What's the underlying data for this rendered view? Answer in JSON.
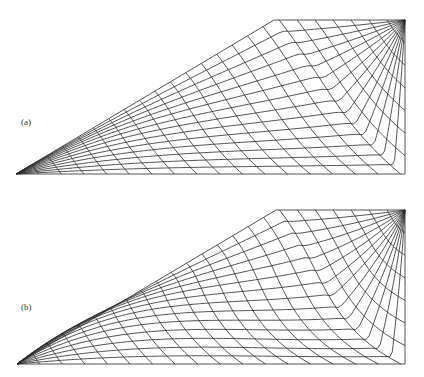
{
  "figure": {
    "panels": [
      {
        "id": "a",
        "label": "(a)",
        "label_pos": [
          21,
          117
        ],
        "geometry": {
          "apex": [
            16,
            174
          ],
          "corner": [
            274,
            20
          ],
          "top_right": [
            405,
            20
          ],
          "bottom_right": [
            405,
            174
          ]
        },
        "mesh": {
          "radial_divisions": 24,
          "arc_divisions": 14,
          "curvature": 0.45
        }
      },
      {
        "id": "b",
        "label": "(b)",
        "label_pos": [
          21,
          114
        ],
        "geometry": {
          "apex": [
            17,
            176
          ],
          "corner": [
            276,
            22
          ],
          "top_right": [
            405,
            22
          ],
          "bottom_right": [
            405,
            176
          ]
        },
        "mesh": {
          "radial_divisions": 24,
          "arc_divisions": 14,
          "curvature": 1.0
        }
      }
    ],
    "colors": {
      "line": "#2a2a2a",
      "background": "#ffffff"
    }
  }
}
